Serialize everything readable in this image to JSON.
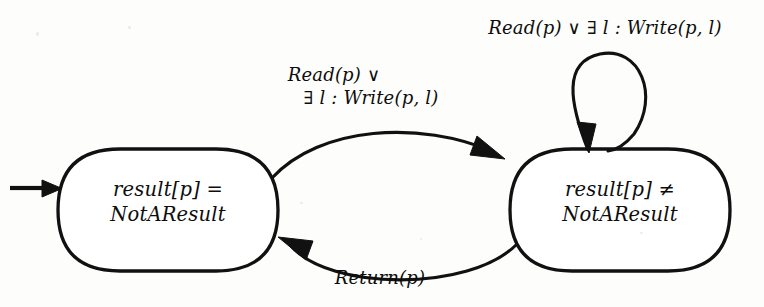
{
  "diagram": {
    "type": "state-transition-diagram",
    "title": "",
    "background_color": "#fdfdfc",
    "ink_color": "#111111",
    "width": 764,
    "height": 307,
    "states": [
      {
        "id": "not-a-result",
        "name": "result-equals-notaresult-state",
        "line1": "result[p] =",
        "line2": "NotAResult",
        "is_initial": true,
        "x": 58,
        "y": 148,
        "w": 220,
        "h": 124
      },
      {
        "id": "a-result",
        "name": "result-not-equals-notaresult-state",
        "line1": "result[p] ≠",
        "line2": "NotAResult",
        "is_initial": false,
        "x": 510,
        "y": 148,
        "w": 220,
        "h": 124
      }
    ],
    "transitions": [
      {
        "id": "t-forward",
        "name": "forward-transition",
        "from": "not-a-result",
        "to": "a-result",
        "label_line1": "Read(p) ∨",
        "label_line2": "∃ l : Write(p, l)",
        "label_full": "Read(p) ∨ ∃ l : Write(p, l)"
      },
      {
        "id": "t-return",
        "name": "return-transition",
        "from": "a-result",
        "to": "not-a-result",
        "label_line1": "Return(p)",
        "label_line2": "",
        "label_full": "Return(p)"
      },
      {
        "id": "t-self-loop",
        "name": "self-loop-transition",
        "from": "a-result",
        "to": "a-result",
        "label_line1": "Read(p) ∨ ∃ l : Write(p, l)",
        "label_line2": "",
        "label_full": "Read(p) ∨ ∃ l : Write(p, l)"
      }
    ],
    "initial_marker": {
      "name": "initial-state-arrow",
      "target": "not-a-result"
    }
  }
}
